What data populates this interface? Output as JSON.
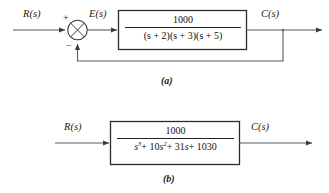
{
  "figure": {
    "caption_a": "(a)",
    "caption_b": "(b)"
  },
  "diagram_a": {
    "input_label": "R(s)",
    "error_label": "E(s)",
    "output_label": "C(s)",
    "summing_junction": {
      "name": "summing-junction",
      "plus_sign": "+",
      "minus_sign": "−"
    },
    "block": {
      "numerator": "1000",
      "denominator": "(s + 2)(s + 3)(s + 5)"
    },
    "feedback": {
      "type": "unity",
      "label": ""
    }
  },
  "diagram_b": {
    "input_label": "R(s)",
    "output_label": "C(s)",
    "block": {
      "numerator": "1000",
      "denominator_parts": {
        "t1_base": "s",
        "t1_exp": "3",
        "t2_coef": "+ 10",
        "t2_base": "s",
        "t2_exp": "2",
        "t3": "+ 31",
        "t3_base": "s",
        "t4": "+ 1030"
      },
      "denominator_plain": "s^3 + 10s^2 + 31s + 1030"
    }
  },
  "colors": {
    "line": "#4a4a4a",
    "box_border": "#2b2b2b",
    "text": "#121212",
    "background": "#ffffff"
  }
}
